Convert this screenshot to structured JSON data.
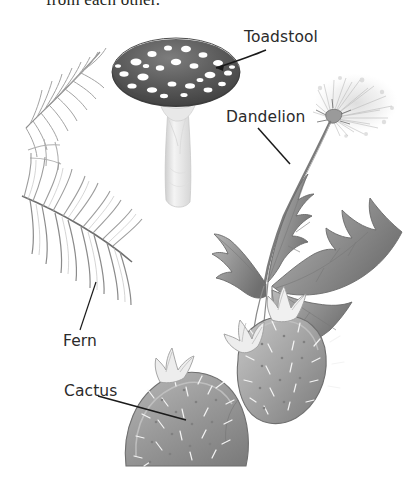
{
  "page": {
    "background_color": "#ffffff",
    "width": 411,
    "height": 494,
    "cut_off_body_text": "from each other."
  },
  "labels": {
    "toadstool": "Toadstool",
    "dandelion": "Dandelion",
    "fern": "Fern",
    "cactus": "Cactus"
  },
  "illustrations": [
    {
      "name": "fern",
      "description": "Pencil-style fern fronds with central rachis and many pinnae, upper-left of page",
      "tone": "#9a9a9a"
    },
    {
      "name": "toadstool",
      "description": "Spotted mushroom with dark domed cap, white spots and pale tapering stem",
      "cap_color": "#5d5d5d",
      "spot_color": "#ffffff",
      "stem_color": "#e0e0e0"
    },
    {
      "name": "dandelion",
      "description": "Dandelion plant with deeply toothed lobed leaves and a fluffy white seed head on a long stem",
      "leaf_color": "#8e8e8e",
      "seedhead_color": "#c9c9c9"
    },
    {
      "name": "cactus",
      "description": "Prickly pear cactus with two rounded pads, pale spines and pale flowers on top",
      "pad_color": "#9b9b9b",
      "spine_color": "#f2f2f2"
    }
  ],
  "leader_lines": [
    {
      "name": "toadstool-leader",
      "style": "arrow",
      "from": "label right of cap",
      "to": "mushroom cap"
    },
    {
      "name": "dandelion-leader",
      "style": "line",
      "from": "label",
      "to": "dandelion leaf"
    },
    {
      "name": "fern-leader",
      "style": "line",
      "from": "label",
      "to": "fern pinna"
    },
    {
      "name": "cactus-leader",
      "style": "line",
      "from": "label",
      "to": "cactus pad"
    }
  ],
  "colors": {
    "text": "#2b2b2b",
    "line": "#1a1a1a",
    "background": "#ffffff"
  }
}
